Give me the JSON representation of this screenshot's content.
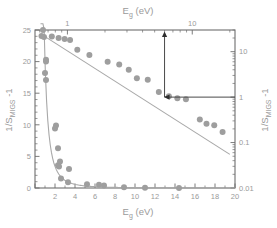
{
  "figure": {
    "background_color": "#ffffff",
    "frame_color": "#6e6e6e",
    "marker_color": "#9e9e9e",
    "fit_color": "#a8a8a8",
    "annotation_color": "#2e2e2e",
    "label_color": "#9a9a9a"
  },
  "labels": {
    "top_axis_title": "E",
    "top_axis_title_sub": "g",
    "top_axis_title_unit": " (eV)",
    "bottom_axis_title": "E",
    "bottom_axis_title_sub": "g",
    "bottom_axis_title_unit": " (eV)",
    "left_axis_title": "1/S",
    "left_axis_title_sub": "MIGS",
    "left_axis_title_tail": " -1",
    "right_axis_title": "1/S",
    "right_axis_title_sub": "MIGS",
    "right_axis_title_tail": " -1"
  },
  "chart_data": {
    "type": "scatter",
    "title": "",
    "axes": {
      "bottom": {
        "label": "E_g (eV)",
        "scale": "linear",
        "range": [
          0,
          20
        ],
        "ticks": [
          0,
          2,
          4,
          6,
          8,
          10,
          12,
          14,
          16,
          18,
          20
        ],
        "ticklabels": [
          "",
          "2",
          "4",
          "6",
          "8",
          "10",
          "12",
          "14",
          "16",
          "18",
          "20"
        ],
        "minor_tick_step": 1
      },
      "left": {
        "label": "1/S_MIGS -1",
        "scale": "linear",
        "range": [
          0,
          25
        ],
        "ticks": [
          0,
          5,
          10,
          15,
          20,
          25
        ],
        "ticklabels": [
          "0",
          "5",
          "10",
          "15",
          "20",
          "25"
        ],
        "minor_tick_step": 1
      },
      "top": {
        "label": "E_g (eV)",
        "scale": "log",
        "range": [
          0.55,
          22
        ],
        "ticks": [
          1,
          10
        ],
        "ticklabels": [
          "1",
          "10"
        ],
        "minor_ticks": [
          0.6,
          0.7,
          0.8,
          0.9,
          2,
          3,
          4,
          5,
          6,
          7,
          8,
          9,
          20
        ]
      },
      "right": {
        "label": "1/S_MIGS -1",
        "scale": "log",
        "range": [
          0.01,
          30
        ],
        "ticks": [
          0.01,
          0.1,
          1,
          10
        ],
        "ticklabels": [
          "0.01",
          "0.1",
          "1",
          "10"
        ]
      },
      "grid": false,
      "legend": "none"
    },
    "series": [
      {
        "name": "linear-scale data (bottom/left axes)",
        "marker": "filled-circle",
        "color": "#9e9e9e",
        "points": [
          {
            "x": 0.8,
            "y": 25.0
          },
          {
            "x": 0.9,
            "y": 23.9
          },
          {
            "x": 1.1,
            "y": 20.3
          },
          {
            "x": 1.1,
            "y": 20.0
          },
          {
            "x": 1.0,
            "y": 18.2
          },
          {
            "x": 1.1,
            "y": 17.1
          },
          {
            "x": 2.1,
            "y": 9.9
          },
          {
            "x": 2.0,
            "y": 9.4
          },
          {
            "x": 2.3,
            "y": 6.3
          },
          {
            "x": 2.5,
            "y": 4.2
          },
          {
            "x": 2.3,
            "y": 3.6
          },
          {
            "x": 2.4,
            "y": 3.4
          },
          {
            "x": 3.4,
            "y": 3.0
          },
          {
            "x": 2.6,
            "y": 1.5
          },
          {
            "x": 3.3,
            "y": 0.9
          },
          {
            "x": 5.2,
            "y": 0.6
          },
          {
            "x": 6.4,
            "y": 0.5
          },
          {
            "x": 6.9,
            "y": 0.4
          },
          {
            "x": 8.9,
            "y": 0.1
          },
          {
            "x": 11.0,
            "y": 0.05
          },
          {
            "x": 14.4,
            "y": 0.0
          }
        ]
      },
      {
        "name": "log-scale data (top/right axes)",
        "marker": "filled-circle",
        "color": "#9e9e9e",
        "points": [
          {
            "x": 0.62,
            "y": 22.0
          },
          {
            "x": 0.75,
            "y": 21.5
          },
          {
            "x": 0.85,
            "y": 20.0
          },
          {
            "x": 0.95,
            "y": 19.0
          },
          {
            "x": 1.05,
            "y": 18.0
          },
          {
            "x": 1.2,
            "y": 11.0
          },
          {
            "x": 1.5,
            "y": 8.5
          },
          {
            "x": 2.1,
            "y": 6.0
          },
          {
            "x": 2.6,
            "y": 5.2
          },
          {
            "x": 3.1,
            "y": 4.0
          },
          {
            "x": 3.6,
            "y": 2.6
          },
          {
            "x": 4.4,
            "y": 2.4
          },
          {
            "x": 5.4,
            "y": 1.3
          },
          {
            "x": 6.5,
            "y": 1.05
          },
          {
            "x": 7.6,
            "y": 0.95
          },
          {
            "x": 8.9,
            "y": 0.9
          },
          {
            "x": 11.5,
            "y": 0.32
          },
          {
            "x": 13.0,
            "y": 0.26
          },
          {
            "x": 15.0,
            "y": 0.24
          },
          {
            "x": 17.5,
            "y": 0.17
          }
        ]
      }
    ],
    "fits": [
      {
        "name": "power-law decay fit (linear axes)",
        "type": "curve",
        "color": "#a8a8a8"
      },
      {
        "name": "log-log straight line fit",
        "type": "line",
        "color": "#a8a8a8",
        "from": {
          "x": 0.62,
          "y": 24.0
        },
        "to": {
          "x": 20.0,
          "y": 0.055
        }
      }
    ],
    "annotations": [
      {
        "name": "vertical-arrow-up",
        "description": "Arrow from corner point upward to the top logarithmic axis",
        "direction": "up",
        "x_value": 6.0
      },
      {
        "name": "horizontal-arrow-left",
        "description": "Arrow from the right logarithmic axis at value 1 pointing left to the corner point",
        "direction": "left",
        "y_value": 1
      }
    ]
  }
}
